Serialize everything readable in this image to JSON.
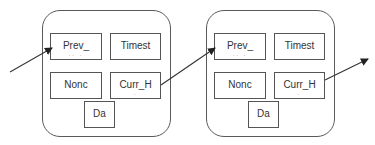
{
  "diagram": {
    "type": "blockchain-linked-blocks",
    "colors": {
      "stroke": "#555555",
      "text": "#333333",
      "background": "#ffffff"
    },
    "blocks": [
      {
        "id": "block-1",
        "fields": {
          "prev_hash": {
            "label": "Prev_",
            "sub": ".. ."
          },
          "timestamp": {
            "label": "Timest"
          },
          "nonce": {
            "label": "Nonc"
          },
          "curr_hash": {
            "label": "Curr_H",
            "sub": "."
          },
          "data": {
            "label": "Da"
          }
        }
      },
      {
        "id": "block-2",
        "fields": {
          "prev_hash": {
            "label": "Prev_",
            "sub": ".. ."
          },
          "timestamp": {
            "label": "Timest"
          },
          "nonce": {
            "label": "Nonc"
          },
          "curr_hash": {
            "label": "Curr_H",
            "sub": "."
          },
          "data": {
            "label": "Da"
          }
        }
      }
    ],
    "edges": [
      {
        "from": "external-left",
        "to": "block-1.prev_hash"
      },
      {
        "from": "block-1.curr_hash",
        "to": "block-2.prev_hash"
      },
      {
        "from": "block-2.curr_hash",
        "to": "external-right"
      }
    ]
  }
}
